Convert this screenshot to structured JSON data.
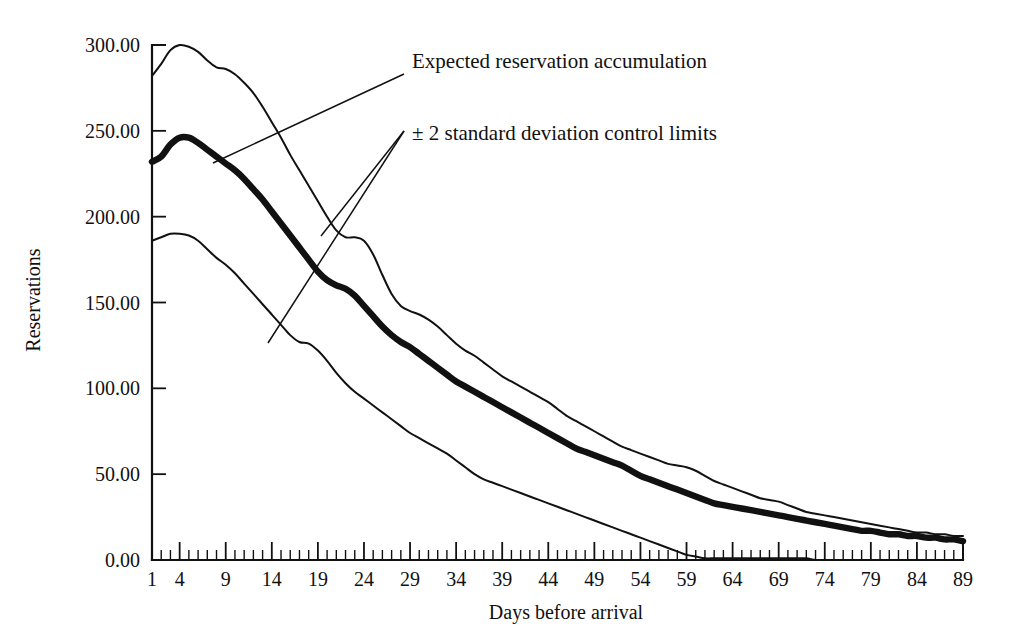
{
  "chart_data": {
    "type": "line",
    "title": "",
    "xlabel": "Days before arrival",
    "ylabel": "Reservations",
    "xlim": [
      1,
      89
    ],
    "ylim": [
      0,
      300
    ],
    "grid": false,
    "legend_position": "none",
    "y_ticks": [
      0,
      50,
      100,
      150,
      200,
      250,
      300
    ],
    "y_tick_labels": [
      "0.00",
      "50.00",
      "100.00",
      "150.00",
      "200.00",
      "250.00",
      "300.00"
    ],
    "x_ticks": [
      1,
      4,
      9,
      14,
      19,
      24,
      29,
      34,
      39,
      44,
      49,
      54,
      59,
      64,
      69,
      74,
      79,
      84,
      89
    ],
    "x_tick_labels": [
      "1",
      "4",
      "9",
      "14",
      "19",
      "24",
      "29",
      "34",
      "39",
      "44",
      "49",
      "54",
      "59",
      "64",
      "69",
      "74",
      "79",
      "84",
      "89"
    ],
    "x_minor_tick_step": 1,
    "series": [
      {
        "name": "Upper 2-sigma control limit",
        "style": "thin",
        "x": [
          1,
          2,
          3,
          4,
          5,
          6,
          7,
          8,
          9,
          10,
          11,
          12,
          13,
          14,
          15,
          16,
          17,
          18,
          19,
          20,
          21,
          22,
          23,
          24,
          25,
          26,
          27,
          28,
          29,
          30,
          31,
          32,
          33,
          34,
          35,
          36,
          37,
          38,
          39,
          40,
          41,
          42,
          43,
          44,
          45,
          46,
          47,
          48,
          49,
          50,
          51,
          52,
          53,
          54,
          55,
          56,
          57,
          58,
          59,
          60,
          61,
          62,
          63,
          64,
          65,
          66,
          67,
          68,
          69,
          70,
          71,
          72,
          73,
          74,
          75,
          76,
          77,
          78,
          79,
          80,
          81,
          82,
          83,
          84,
          85,
          86,
          87,
          88,
          89
        ],
        "y": [
          282,
          289,
          297,
          300,
          299,
          296,
          291,
          287,
          286,
          283,
          278,
          272,
          264,
          255,
          246,
          236,
          227,
          218,
          209,
          200,
          192,
          188,
          188,
          186,
          178,
          166,
          155,
          148,
          145,
          143,
          140,
          136,
          131,
          126,
          122,
          119,
          115,
          111,
          107,
          104,
          101,
          98,
          95,
          92,
          88,
          84,
          81,
          78,
          75,
          72,
          69,
          66,
          64,
          62,
          60,
          58,
          56,
          55,
          54,
          52,
          49,
          46,
          44,
          42,
          40,
          38,
          36,
          35,
          34,
          32,
          30,
          28,
          27,
          26,
          25,
          24,
          23,
          22,
          21,
          20,
          19,
          18,
          17,
          16,
          16,
          15,
          15,
          14,
          14
        ]
      },
      {
        "name": "Expected reservation accumulation",
        "style": "thick",
        "x": [
          1,
          2,
          3,
          4,
          5,
          6,
          7,
          8,
          9,
          10,
          11,
          12,
          13,
          14,
          15,
          16,
          17,
          18,
          19,
          20,
          21,
          22,
          23,
          24,
          25,
          26,
          27,
          28,
          29,
          30,
          31,
          32,
          33,
          34,
          35,
          36,
          37,
          38,
          39,
          40,
          41,
          42,
          43,
          44,
          45,
          46,
          47,
          48,
          49,
          50,
          51,
          52,
          53,
          54,
          55,
          56,
          57,
          58,
          59,
          60,
          61,
          62,
          63,
          64,
          65,
          66,
          67,
          68,
          69,
          70,
          71,
          72,
          73,
          74,
          75,
          76,
          77,
          78,
          79,
          80,
          81,
          82,
          83,
          84,
          85,
          86,
          87,
          88,
          89
        ],
        "y": [
          232,
          235,
          242,
          246,
          246,
          243,
          239,
          235,
          231,
          227,
          222,
          216,
          210,
          203,
          196,
          189,
          182,
          175,
          168,
          163,
          160,
          158,
          154,
          148,
          142,
          136,
          131,
          127,
          124,
          120,
          116,
          112,
          108,
          104,
          101,
          98,
          95,
          92,
          89,
          86,
          83,
          80,
          77,
          74,
          71,
          68,
          65,
          63,
          61,
          59,
          57,
          55,
          52,
          49,
          47,
          45,
          43,
          41,
          39,
          37,
          35,
          33,
          32,
          31,
          30,
          29,
          28,
          27,
          26,
          25,
          24,
          23,
          22,
          21,
          20,
          19,
          18,
          17,
          17,
          16,
          15,
          15,
          14,
          14,
          13,
          13,
          12,
          12,
          11
        ]
      },
      {
        "name": "Lower 2-sigma control limit",
        "style": "thin",
        "x": [
          1,
          2,
          3,
          4,
          5,
          6,
          7,
          8,
          9,
          10,
          11,
          12,
          13,
          14,
          15,
          16,
          17,
          18,
          19,
          20,
          21,
          22,
          23,
          24,
          25,
          26,
          27,
          28,
          29,
          30,
          31,
          32,
          33,
          34,
          35,
          36,
          37,
          38,
          39,
          40,
          41,
          42,
          43,
          44,
          45,
          46,
          47,
          48,
          49,
          50,
          51,
          52,
          53,
          54,
          55,
          56,
          57,
          58,
          59,
          60,
          61,
          62,
          63,
          64,
          65,
          66,
          67,
          68,
          69,
          70,
          71,
          72,
          73,
          74,
          75,
          76,
          77,
          78,
          79,
          80,
          81,
          82,
          83,
          84,
          85,
          86,
          87,
          88,
          89
        ],
        "y": [
          186,
          188,
          190,
          190,
          189,
          186,
          181,
          176,
          172,
          167,
          161,
          155,
          149,
          143,
          137,
          131,
          127,
          126,
          122,
          116,
          109,
          103,
          98,
          94,
          90,
          86,
          82,
          78,
          74,
          71,
          68,
          65,
          62,
          58,
          54,
          50,
          47,
          45,
          43,
          41,
          39,
          37,
          35,
          33,
          31,
          29,
          27,
          25,
          23,
          21,
          19,
          17,
          15,
          13,
          11,
          9,
          7,
          5,
          3,
          2,
          1,
          1,
          1,
          1,
          1,
          1,
          1,
          1,
          1,
          1,
          1,
          1,
          0,
          0,
          0,
          0,
          0,
          0,
          0,
          0,
          0,
          0,
          0,
          0,
          0,
          0,
          0,
          0,
          0
        ]
      }
    ],
    "annotations": [
      {
        "label": "Expected reservation accumulation",
        "text_x": 412,
        "text_y": 68,
        "leaders": [
          [
            404,
            74,
            213,
            163
          ]
        ]
      },
      {
        "label": "± 2 standard deviation control limits",
        "text_x": 412,
        "text_y": 140,
        "leaders": [
          [
            404,
            131,
            321,
            236
          ],
          [
            404,
            131,
            268,
            343
          ]
        ]
      }
    ]
  }
}
